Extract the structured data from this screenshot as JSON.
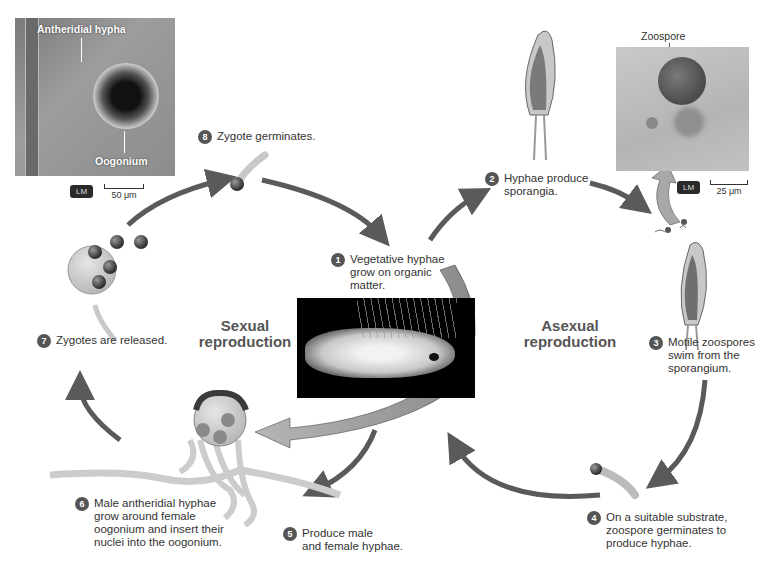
{
  "figure": {
    "type": "life-cycle-diagram"
  },
  "cycles": {
    "sexual": {
      "title_line1": "Sexual",
      "title_line2": "reproduction"
    },
    "asexual": {
      "title_line1": "Asexual",
      "title_line2": "reproduction"
    }
  },
  "steps": [
    {
      "number": "1",
      "text": "Vegetative hyphae grow on organic matter.",
      "lines": [
        "Vegetative hyphae",
        "grow on organic",
        "matter."
      ]
    },
    {
      "number": "2",
      "text": "Hyphae produce sporangia.",
      "lines": [
        "Hyphae produce",
        "sporangia."
      ]
    },
    {
      "number": "3",
      "text": "Motile zoospores swim from the sporangium.",
      "lines": [
        "Motile zoospores",
        "swim from the",
        "sporangium."
      ]
    },
    {
      "number": "4",
      "text": "On a suitable substrate, zoospore germinates to produce hyphae.",
      "lines": [
        "On a suitable substrate,",
        "zoospore germinates to",
        "produce hyphae."
      ]
    },
    {
      "number": "5",
      "text": "Produce male and female hyphae.",
      "lines": [
        "Produce male",
        "and female hyphae."
      ]
    },
    {
      "number": "6",
      "text": "Male antheridial hyphae grow around female oogonium and insert their nuclei into the oogonium.",
      "lines": [
        "Male antheridial hyphae",
        "grow around female",
        "oogonium and insert their",
        "nuclei into the oogonium."
      ]
    },
    {
      "number": "7",
      "text": "Zygotes are released.",
      "lines": [
        "Zygotes are released."
      ]
    },
    {
      "number": "8",
      "text": "Zygote germinates.",
      "lines": [
        "Zygote germinates."
      ]
    }
  ],
  "micrographs": {
    "left": {
      "label_top": "Antheridial hypha",
      "label_bottom": "Oogonium",
      "method": "LM",
      "scale": "50 μm"
    },
    "right": {
      "label_top": "Zoospore",
      "method": "LM",
      "scale": "25 μm"
    }
  },
  "colors": {
    "arrow": "#5a5a5a",
    "badge": "#555555",
    "wide_arrow": "#9a9a9a",
    "photo_bg": "#000000"
  }
}
